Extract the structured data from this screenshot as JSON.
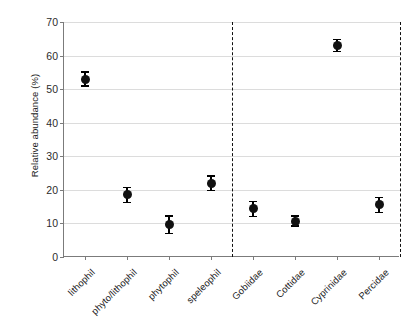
{
  "chart_data": {
    "type": "scatter",
    "title": "",
    "xlabel": "",
    "ylabel": "Relative abundance (%)",
    "ylim": [
      0,
      70
    ],
    "ytick_labels": [
      "0",
      "10",
      "20",
      "30",
      "40",
      "50",
      "60",
      "70"
    ],
    "ytick_values": [
      0,
      10,
      20,
      30,
      40,
      50,
      60,
      70
    ],
    "grid": "horizontal",
    "legend": "none",
    "errorbar_type": "symmetric",
    "group_divider_after_index": 3,
    "categories": [
      "lithophil",
      "phyto/lithophil",
      "phytophil",
      "speleophil",
      "Gobiidae",
      "Cottidae",
      "Cyprinidae",
      "Percidae"
    ],
    "values": [
      53.0,
      18.5,
      9.6,
      22.0,
      14.3,
      10.7,
      63.0,
      15.5
    ],
    "err_low": [
      2.3,
      2.5,
      2.8,
      2.4,
      2.4,
      1.7,
      2.0,
      2.4
    ],
    "err_high": [
      2.3,
      2.5,
      2.8,
      2.4,
      2.4,
      1.7,
      2.0,
      2.4
    ],
    "marker_color": "#111111",
    "grid_color": "#dcdcdc",
    "axis_color": "#7b7b7b",
    "divider_color": "#111111",
    "background_color": "#ffffff"
  }
}
